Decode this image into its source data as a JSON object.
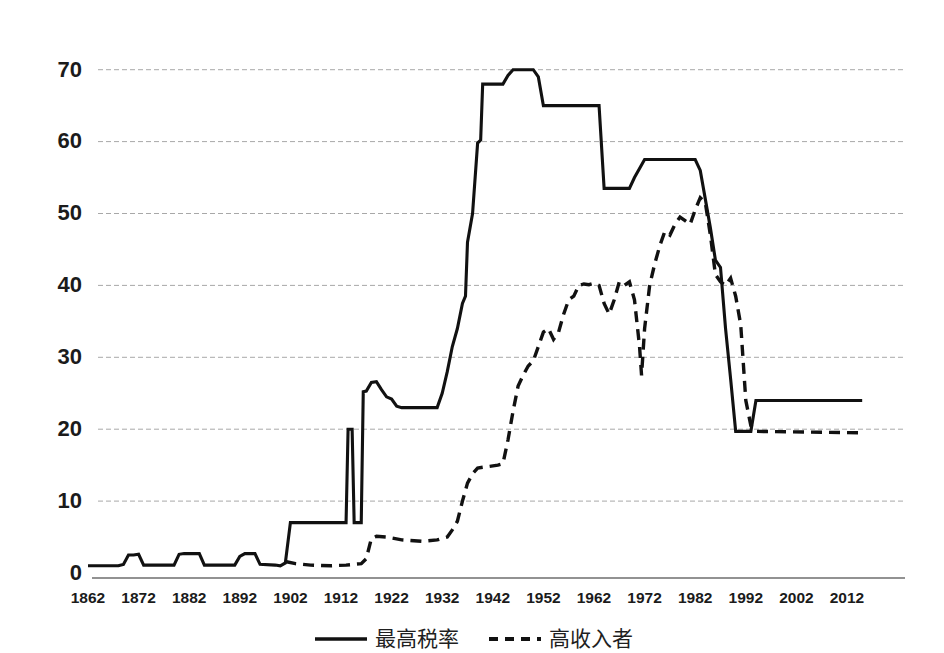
{
  "chart_data": {
    "type": "line",
    "title": "",
    "subtitle": "",
    "xlabel": "",
    "ylabel": "",
    "xlim": [
      1862,
      2015
    ],
    "ylim": [
      0,
      73
    ],
    "grid": true,
    "grid_axis": "y",
    "legend_position": "bottom-center",
    "x_ticks": [
      1862,
      1872,
      1882,
      1892,
      1902,
      1912,
      1922,
      1932,
      1942,
      1952,
      1962,
      1972,
      1982,
      1992,
      2002,
      2012
    ],
    "y_ticks": [
      0,
      10,
      20,
      30,
      40,
      50,
      60,
      70
    ],
    "series": [
      {
        "name": "最高税率",
        "style": "solid",
        "color": "#111111",
        "points": [
          [
            1862,
            1.0
          ],
          [
            1868,
            1.0
          ],
          [
            1869,
            1.2
          ],
          [
            1870,
            2.5
          ],
          [
            1871,
            2.5
          ],
          [
            1872,
            2.6
          ],
          [
            1873,
            1.1
          ],
          [
            1879,
            1.1
          ],
          [
            1880,
            2.6
          ],
          [
            1881,
            2.7
          ],
          [
            1884,
            2.7
          ],
          [
            1885,
            1.1
          ],
          [
            1891,
            1.1
          ],
          [
            1892,
            2.3
          ],
          [
            1893,
            2.7
          ],
          [
            1895,
            2.7
          ],
          [
            1896,
            1.2
          ],
          [
            1899,
            1.1
          ],
          [
            1900,
            1.0
          ],
          [
            1901,
            1.4
          ],
          [
            1902,
            7.0
          ],
          [
            1912,
            7.0
          ],
          [
            1913,
            7.0
          ],
          [
            1913.4,
            20.0
          ],
          [
            1914.2,
            20.0
          ],
          [
            1914.6,
            7.0
          ],
          [
            1916,
            7.0
          ],
          [
            1916.4,
            25.2
          ],
          [
            1917,
            25.3
          ],
          [
            1918,
            26.5
          ],
          [
            1919,
            26.6
          ],
          [
            1920,
            25.5
          ],
          [
            1921,
            24.5
          ],
          [
            1922,
            24.2
          ],
          [
            1923,
            23.2
          ],
          [
            1924,
            23.0
          ],
          [
            1925,
            23.0
          ],
          [
            1931,
            23.0
          ],
          [
            1932,
            25.0
          ],
          [
            1933,
            28.0
          ],
          [
            1934,
            31.5
          ],
          [
            1935,
            34.0
          ],
          [
            1936,
            37.5
          ],
          [
            1936.6,
            38.5
          ],
          [
            1937,
            46.0
          ],
          [
            1938,
            50.0
          ],
          [
            1939,
            59.8
          ],
          [
            1939.6,
            60.2
          ],
          [
            1940,
            68.0
          ],
          [
            1944,
            68.0
          ],
          [
            1945,
            69.2
          ],
          [
            1946,
            70.0
          ],
          [
            1950,
            70.0
          ],
          [
            1951,
            69.0
          ],
          [
            1952,
            65.0
          ],
          [
            1963,
            65.0
          ],
          [
            1964,
            53.5
          ],
          [
            1969,
            53.5
          ],
          [
            1970,
            55.0
          ],
          [
            1972,
            57.5
          ],
          [
            1982,
            57.5
          ],
          [
            1983,
            56.0
          ],
          [
            1984,
            52.0
          ],
          [
            1985,
            48.0
          ],
          [
            1986,
            43.5
          ],
          [
            1987,
            42.5
          ],
          [
            1988,
            34.0
          ],
          [
            1989,
            27.0
          ],
          [
            1990,
            19.7
          ],
          [
            1993,
            19.7
          ],
          [
            1994,
            24.0
          ],
          [
            2015,
            24.0
          ]
        ]
      },
      {
        "name": "高收入者",
        "style": "dashed",
        "color": "#111111",
        "points": [
          [
            1901,
            1.6
          ],
          [
            1903,
            1.3
          ],
          [
            1906,
            1.1
          ],
          [
            1910,
            1.0
          ],
          [
            1913,
            1.1
          ],
          [
            1916,
            1.3
          ],
          [
            1917,
            2.0
          ],
          [
            1918,
            4.8
          ],
          [
            1919,
            5.1
          ],
          [
            1921,
            5.0
          ],
          [
            1924,
            4.6
          ],
          [
            1928,
            4.4
          ],
          [
            1931,
            4.6
          ],
          [
            1933,
            5.0
          ],
          [
            1934,
            6.0
          ],
          [
            1935,
            7.2
          ],
          [
            1936,
            10.0
          ],
          [
            1937,
            12.5
          ],
          [
            1938,
            13.8
          ],
          [
            1939,
            14.6
          ],
          [
            1941,
            14.8
          ],
          [
            1943,
            15.0
          ],
          [
            1944,
            15.2
          ],
          [
            1945,
            18.5
          ],
          [
            1946,
            22.5
          ],
          [
            1947,
            26.0
          ],
          [
            1948,
            27.5
          ],
          [
            1949,
            28.8
          ],
          [
            1950,
            29.5
          ],
          [
            1951,
            31.5
          ],
          [
            1952,
            33.5
          ],
          [
            1953,
            34.0
          ],
          [
            1954,
            32.5
          ],
          [
            1955,
            33.5
          ],
          [
            1956,
            36.0
          ],
          [
            1957,
            38.0
          ],
          [
            1958,
            38.5
          ],
          [
            1959,
            40.0
          ],
          [
            1960,
            40.2
          ],
          [
            1961,
            40.1
          ],
          [
            1962,
            40.3
          ],
          [
            1963,
            40.0
          ],
          [
            1964,
            37.5
          ],
          [
            1965,
            36.0
          ],
          [
            1966,
            38.0
          ],
          [
            1967,
            40.5
          ],
          [
            1968,
            40.0
          ],
          [
            1969,
            40.5
          ],
          [
            1970,
            38.0
          ],
          [
            1971,
            31.5
          ],
          [
            1971.4,
            27.5
          ],
          [
            1972,
            34.0
          ],
          [
            1973,
            40.0
          ],
          [
            1974,
            43.0
          ],
          [
            1975,
            45.5
          ],
          [
            1976,
            47.5
          ],
          [
            1977,
            47.0
          ],
          [
            1978,
            48.5
          ],
          [
            1979,
            49.5
          ],
          [
            1980,
            49.0
          ],
          [
            1981,
            48.5
          ],
          [
            1982,
            50.5
          ],
          [
            1983,
            52.2
          ],
          [
            1984,
            51.5
          ],
          [
            1985,
            47.0
          ],
          [
            1986,
            41.5
          ],
          [
            1987,
            40.5
          ],
          [
            1988,
            40.0
          ],
          [
            1989,
            41.0
          ],
          [
            1990,
            38.5
          ],
          [
            1991,
            34.5
          ],
          [
            1992,
            24.0
          ],
          [
            1993,
            20.5
          ],
          [
            1994,
            19.7
          ],
          [
            2015,
            19.5
          ]
        ]
      }
    ],
    "legend": [
      {
        "label": "最高税率",
        "style": "solid"
      },
      {
        "label": "高收入者",
        "style": "dashed"
      }
    ]
  },
  "axis": {
    "y_tick_labels": [
      "70",
      "60",
      "50",
      "40",
      "30",
      "20",
      "10",
      "0"
    ],
    "x_tick_labels": [
      "1862",
      "1872",
      "1882",
      "1892",
      "1902",
      "1912",
      "1922",
      "1932",
      "1942",
      "1952",
      "1962",
      "1972",
      "1982",
      "1992",
      "2002",
      "2012"
    ]
  },
  "legend": {
    "items": [
      {
        "label": "最高税率",
        "style": "solid"
      },
      {
        "label": "高收入者",
        "style": "dashed"
      }
    ]
  },
  "colors": {
    "line": "#111111",
    "grid": "#9a9a9a",
    "axis": "#6e6e6e",
    "text": "#1b1b1b",
    "background": "#ffffff"
  }
}
